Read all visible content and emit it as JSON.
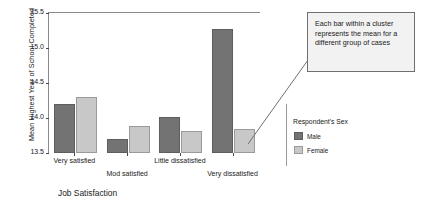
{
  "chart_data": {
    "type": "bar",
    "title": "",
    "xlabel": "Job Satisfaction",
    "ylabel": "Mean Highest Year of School Completed",
    "categories": [
      "Very satisfied",
      "Mod satisfied",
      "Little dissatisfied",
      "Very dissatisfied"
    ],
    "series": [
      {
        "name": "Male",
        "color": "#737373",
        "values": [
          14.2,
          13.7,
          14.02,
          15.27
        ]
      },
      {
        "name": "Female",
        "color": "#c8c8c8",
        "values": [
          14.3,
          13.89,
          13.81,
          13.84
        ]
      }
    ],
    "ylim": [
      13.5,
      15.5
    ],
    "yticks": [
      "15.5",
      "15.0",
      "14.5",
      "14.0",
      "13.5"
    ],
    "ytick_values": [
      15.5,
      15.0,
      14.5,
      14.0,
      13.5
    ],
    "grid": false,
    "legend_position": "right"
  },
  "legend": {
    "title": "Respondent's Sex",
    "items": [
      {
        "label": "Male",
        "color": "#737373"
      },
      {
        "label": "Female",
        "color": "#c8c8c8"
      }
    ]
  },
  "callout": {
    "text": "Each bar within a cluster represents the mean for a different group of cases"
  },
  "colors": {
    "male_bar": "#737373",
    "female_bar": "#c8c8c8",
    "axis": "#8a8a8a",
    "callout_bg": "#f2f2f2",
    "callout_border": "#6f6f6f",
    "background": "#ffffff"
  }
}
